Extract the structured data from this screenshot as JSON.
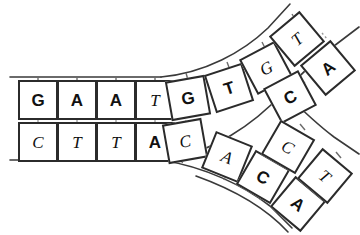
{
  "diagram": {
    "colors": {
      "background": "#ffffff",
      "box_border": "#2b2b2b",
      "box_fill": "#ffffff",
      "backbone": "#3a3a3a",
      "stem": "#6b6b6b",
      "hbond": "#9a9a9a",
      "text": "#111111"
    },
    "parental_duplex": {
      "name": "parental-duplex",
      "top_strand": [
        {
          "base": "G",
          "style": "bold",
          "x": 18,
          "y": 80,
          "rot": 0
        },
        {
          "base": "A",
          "style": "bold",
          "x": 57,
          "y": 80,
          "rot": 0
        },
        {
          "base": "A",
          "style": "bold",
          "x": 96,
          "y": 80,
          "rot": 0
        },
        {
          "base": "T",
          "style": "italic",
          "x": 135,
          "y": 80,
          "rot": 0
        }
      ],
      "bottom_strand": [
        {
          "base": "C",
          "style": "italic",
          "x": 18,
          "y": 122,
          "rot": 0
        },
        {
          "base": "T",
          "style": "italic",
          "x": 57,
          "y": 122,
          "rot": 0
        },
        {
          "base": "T",
          "style": "italic",
          "x": 96,
          "y": 122,
          "rot": 0
        },
        {
          "base": "A",
          "style": "bold",
          "x": 135,
          "y": 122,
          "rot": 0
        }
      ]
    },
    "upper_branch": {
      "name": "leading-strand-branch",
      "outer_strand": [
        {
          "base": "G",
          "style": "bold",
          "x": 168,
          "y": 78,
          "rot": -10
        },
        {
          "base": "T",
          "style": "bold",
          "x": 209,
          "y": 68,
          "rot": -18
        },
        {
          "base": "G",
          "style": "italic",
          "x": 246,
          "y": 48,
          "rot": -28
        },
        {
          "base": "T",
          "style": "italic",
          "x": 277,
          "y": 19,
          "rot": -40
        }
      ],
      "inner_strand": [
        {
          "base": "C",
          "style": "italic",
          "x": 165,
          "y": 121,
          "rot": -10
        },
        {
          "base": "C",
          "style": "bold",
          "x": 270,
          "y": 77,
          "rot": -28
        },
        {
          "base": "A",
          "style": "bold",
          "x": 308,
          "y": 48,
          "rot": -40
        }
      ]
    },
    "lower_branch": {
      "name": "lagging-strand-branch",
      "inner_strand": [
        {
          "base": "A",
          "style": "italic",
          "x": 207,
          "y": 137,
          "rot": 22
        },
        {
          "base": "C",
          "style": "bold",
          "x": 243,
          "y": 157,
          "rot": 30
        },
        {
          "base": "A",
          "style": "bold",
          "x": 278,
          "y": 184,
          "rot": 40
        }
      ],
      "outer_strand": [
        {
          "base": "C",
          "style": "italic",
          "x": 268,
          "y": 127,
          "rot": 30
        },
        {
          "base": "T",
          "style": "italic",
          "x": 305,
          "y": 156,
          "rot": 40
        }
      ]
    },
    "backbones": {
      "top_parental": "M 10 77 L 160 77",
      "bottom_parental": "M 10 160 L 160 160",
      "upper_outer": "M 160 77 C 210 72 248 48 275 22 L 300 2",
      "upper_inner": "M 160 160 C 215 152 258 120 290 86 L 330 47 L 358 22",
      "lower_inner": "M 160 160 C 205 168 245 188 272 208 L 300 230",
      "lower_outer_upper": "M 290 86 L 330 118 L 358 142",
      "lower_outer": "M 200 177 C 240 192 270 210 292 232"
    }
  }
}
